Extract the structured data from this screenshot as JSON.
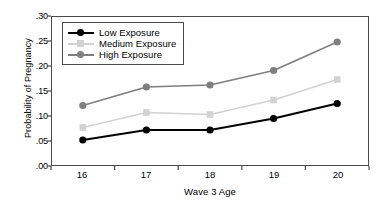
{
  "chart_data": {
    "type": "line",
    "title": "",
    "xlabel": "Wave 3 Age",
    "ylabel": "Probability of Pregnancy",
    "categories": [
      "16",
      "17",
      "18",
      "19",
      "20"
    ],
    "x": [
      16,
      17,
      18,
      19,
      20
    ],
    "xlim": [
      15.5,
      20.5
    ],
    "ylim": [
      0.0,
      0.3
    ],
    "yticks": [
      ".00",
      ".05",
      ".10",
      ".15",
      ".20",
      ".25",
      ".30"
    ],
    "ytick_values": [
      0.0,
      0.05,
      0.1,
      0.15,
      0.2,
      0.25,
      0.3
    ],
    "xticks": [
      "16",
      "17",
      "18",
      "19",
      "20"
    ],
    "grid": false,
    "legend_position": "upper left",
    "series": [
      {
        "name": "Low Exposure",
        "values": [
          0.052,
          0.072,
          0.072,
          0.095,
          0.125
        ],
        "color": "#000000",
        "marker": "circle"
      },
      {
        "name": "Medium Exposure",
        "values": [
          0.077,
          0.107,
          0.103,
          0.132,
          0.173
        ],
        "color": "#d2d2d2",
        "marker": "square"
      },
      {
        "name": "High Exposure",
        "values": [
          0.121,
          0.158,
          0.162,
          0.191,
          0.248
        ],
        "color": "#7f7f7f",
        "marker": "circle"
      }
    ]
  },
  "legend": {
    "items": [
      {
        "label": "Low Exposure"
      },
      {
        "label": "Medium Exposure"
      },
      {
        "label": "High Exposure"
      }
    ]
  }
}
